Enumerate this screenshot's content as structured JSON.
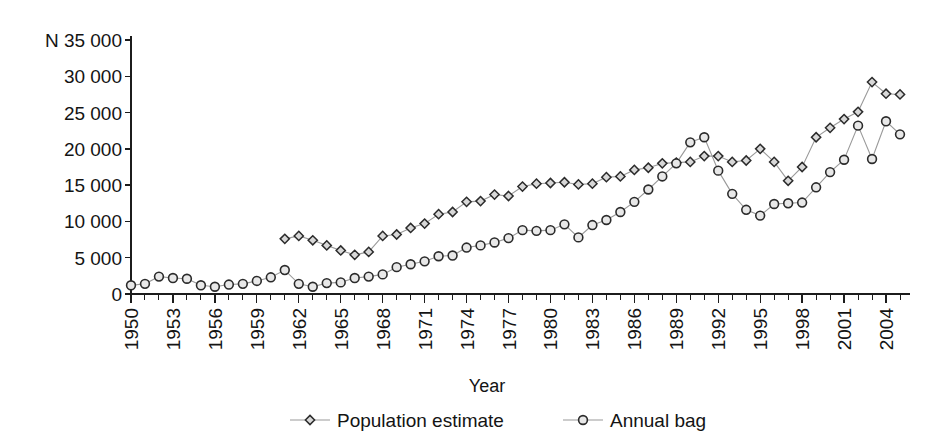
{
  "chart_data": {
    "type": "line",
    "title": "",
    "xlabel": "Year",
    "ylabel": "N",
    "ylim": [
      0,
      35000
    ],
    "ytick_step": 5000,
    "ytick_labels": [
      "0",
      "5 000",
      "10 000",
      "15 000",
      "20 000",
      "25 000",
      "30 000",
      "N 35 000"
    ],
    "xlim": [
      1950,
      2005
    ],
    "xtick_labels": [
      "1950",
      "1953",
      "1956",
      "1959",
      "1962",
      "1965",
      "1968",
      "1971",
      "1974",
      "1977",
      "1980",
      "1983",
      "1986",
      "1989",
      "1992",
      "1995",
      "1998",
      "2001",
      "2004"
    ],
    "xtick_step": 3,
    "grid": false,
    "legend_position": "bottom",
    "x": [
      1950,
      1951,
      1952,
      1953,
      1954,
      1955,
      1956,
      1957,
      1958,
      1959,
      1960,
      1961,
      1962,
      1963,
      1964,
      1965,
      1966,
      1967,
      1968,
      1969,
      1970,
      1971,
      1972,
      1973,
      1974,
      1975,
      1976,
      1977,
      1978,
      1979,
      1980,
      1981,
      1982,
      1983,
      1984,
      1985,
      1986,
      1987,
      1988,
      1989,
      1990,
      1991,
      1992,
      1993,
      1994,
      1995,
      1996,
      1997,
      1998,
      1999,
      2000,
      2001,
      2002,
      2003,
      2004,
      2005
    ],
    "series": [
      {
        "name": "Population estimate",
        "marker": "diamond",
        "values": [
          null,
          null,
          null,
          null,
          null,
          null,
          null,
          null,
          null,
          null,
          null,
          7600,
          8000,
          7400,
          6700,
          6000,
          5400,
          5800,
          8000,
          8200,
          9100,
          9700,
          11000,
          11300,
          12700,
          12800,
          13700,
          13500,
          14800,
          15200,
          15300,
          15400,
          15100,
          15200,
          16100,
          16200,
          17100,
          17400,
          18000,
          18100,
          18200,
          19000,
          19000,
          18200,
          18400,
          20000,
          18200,
          15600,
          17500,
          21600,
          22900,
          24100,
          25100,
          29200,
          27600,
          27500
        ]
      },
      {
        "name": "Annual bag",
        "marker": "circle",
        "values": [
          1200,
          1400,
          2400,
          2200,
          2100,
          1200,
          1000,
          1300,
          1400,
          1800,
          2300,
          3300,
          1400,
          1000,
          1500,
          1600,
          2200,
          2400,
          2700,
          3700,
          4100,
          4500,
          5200,
          5300,
          6400,
          6700,
          7100,
          7700,
          8800,
          8700,
          8800,
          9600,
          7800,
          9500,
          10200,
          11300,
          12700,
          14400,
          16200,
          18000,
          20900,
          21600,
          17000,
          13800,
          11600,
          10800,
          12400,
          12500,
          12600,
          14700,
          16800,
          18500,
          23200,
          18600,
          23800,
          22000
        ]
      }
    ]
  },
  "legend": {
    "items": [
      {
        "label": "Population estimate",
        "marker": "diamond"
      },
      {
        "label": "Annual bag",
        "marker": "circle"
      }
    ]
  },
  "colors": {
    "line": "#9a9a9a",
    "marker_stroke": "#2b2b2b",
    "diamond_fill": "#d8d8d8",
    "circle_fill": "#e8e8e8",
    "axis": "#1c1c1c",
    "text": "#141414"
  }
}
